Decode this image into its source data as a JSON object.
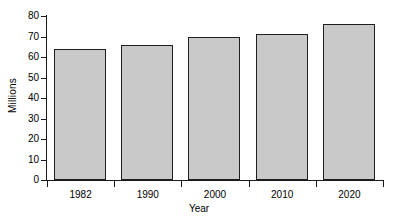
{
  "chart_data": {
    "type": "bar",
    "title": "",
    "subtitle": "",
    "categories": [
      "1982",
      "1990",
      "2000",
      "2010",
      "2020"
    ],
    "values": [
      64,
      66,
      70,
      71,
      76
    ],
    "xlabel": "Year",
    "ylabel": "Millions",
    "ylim": [
      0,
      80
    ],
    "yticks": [
      "0",
      "10",
      "20",
      "30",
      "40",
      "50",
      "60",
      "70",
      "80"
    ],
    "ytick_values": [
      0,
      10,
      20,
      30,
      40,
      50,
      60,
      70,
      80
    ],
    "grid": false,
    "legend": null,
    "annotations": [],
    "colors": {
      "bar_fill": "#c9c9c9",
      "bar_edge": "#1f1f1f",
      "axis": "#1a1a1a",
      "background": "#ffffff",
      "text": "#000000"
    }
  }
}
